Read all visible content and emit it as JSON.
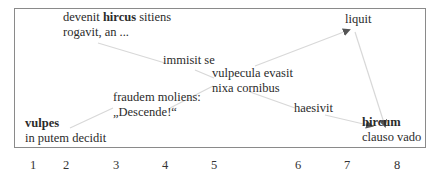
{
  "nodes": {
    "n1": {
      "bold": "vulpes",
      "line2": "in putem decidit"
    },
    "n2": {
      "pre": "devenit ",
      "bold": "hircus",
      "post": " sitiens",
      "line2": "rogavit, an ..."
    },
    "n3": {
      "line1": "fraudem moliens:",
      "line2": "„Descende!“"
    },
    "n4": {
      "line1": "immisit se"
    },
    "n5": {
      "line1": "vulpecula evasit",
      "line2": "nixa cornibus"
    },
    "n6": {
      "line1": "haesivit"
    },
    "n7": {
      "line1": "liquit"
    },
    "n8": {
      "bold": "hircum",
      "line2": "clauso vado"
    }
  },
  "axis": {
    "numbers": [
      "1",
      "2",
      "3",
      "4",
      "5",
      "6",
      "7",
      "8"
    ]
  },
  "colors": {
    "link": "#d8d8d8",
    "arrow": "#555555",
    "frame": "#8a8a8a"
  }
}
